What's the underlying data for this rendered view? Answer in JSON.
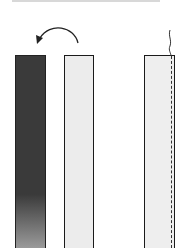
{
  "diagram": {
    "strips": [
      {
        "id": "strip-1",
        "fill": "#3a3a3a",
        "style": "dark, fading at bottom"
      },
      {
        "id": "strip-2",
        "fill": "#ececec",
        "style": "light"
      },
      {
        "id": "strip-3",
        "fill": "#eeeeee",
        "style": "light with dashed fold line near right edge"
      }
    ],
    "annotations": [
      {
        "type": "curved-arrow",
        "from": "strip-2",
        "to": "strip-1",
        "meaning": "flip over"
      },
      {
        "type": "wavy-line",
        "position": "above strip-3 right edge"
      },
      {
        "type": "dashed-line",
        "position": "strip-3 right edge"
      }
    ],
    "colors": {
      "outline": "#1a1a1a",
      "dark": "#3a3a3a",
      "light": "#ececec"
    }
  }
}
